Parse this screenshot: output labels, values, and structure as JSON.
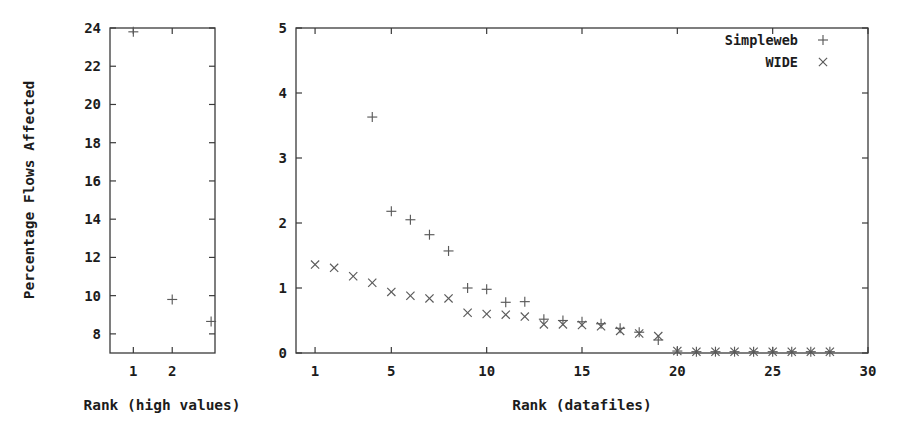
{
  "figure": {
    "background_color": "#ffffff",
    "marker_color": "#5a5a5a",
    "axis_color": "#3a3a3a"
  },
  "chart_data": [
    {
      "id": "left-panel",
      "type": "scatter",
      "title": "",
      "xlabel": "Rank (high values)",
      "ylabel": "Percentage Flows Affected",
      "xlim": [
        0.4,
        3.1
      ],
      "ylim": [
        7.0,
        24.0
      ],
      "xticks": [
        "1",
        "2"
      ],
      "xtick_values": [
        1,
        2
      ],
      "yticks": [
        "8",
        "10",
        "12",
        "14",
        "16",
        "18",
        "20",
        "22",
        "24"
      ],
      "ytick_values": [
        8,
        10,
        12,
        14,
        16,
        18,
        20,
        22,
        24
      ],
      "grid": false,
      "legend": "none",
      "series": [
        {
          "name": "Simpleweb",
          "marker": "plus",
          "x": [
            1,
            2,
            3
          ],
          "y": [
            23.8,
            9.8,
            8.65
          ]
        }
      ]
    },
    {
      "id": "right-panel",
      "type": "scatter",
      "title": "",
      "xlabel": "Rank (datafiles)",
      "ylabel": "",
      "xlim": [
        0.0,
        30.0
      ],
      "ylim": [
        0.0,
        5.0
      ],
      "xticks": [
        "1",
        "5",
        "10",
        "15",
        "20",
        "25",
        "30"
      ],
      "xtick_values": [
        1,
        5,
        10,
        15,
        20,
        25,
        30
      ],
      "yticks": [
        "0",
        "1",
        "2",
        "3",
        "4",
        "5"
      ],
      "ytick_values": [
        0,
        1,
        2,
        3,
        4,
        5
      ],
      "grid": false,
      "legend": "top-right",
      "series": [
        {
          "name": "Simpleweb",
          "marker": "plus",
          "x": [
            4,
            5,
            6,
            7,
            8,
            9,
            10,
            11,
            12,
            13,
            14,
            15,
            16,
            17,
            18,
            19,
            20,
            21,
            22,
            23,
            24,
            25,
            26,
            27,
            28
          ],
          "y": [
            3.63,
            2.18,
            2.05,
            1.82,
            1.57,
            1.0,
            0.98,
            0.78,
            0.79,
            0.52,
            0.5,
            0.48,
            0.45,
            0.38,
            0.32,
            0.2,
            0.03,
            0.02,
            0.02,
            0.02,
            0.02,
            0.02,
            0.02,
            0.02,
            0.02
          ]
        },
        {
          "name": "WIDE",
          "marker": "cross",
          "x": [
            1,
            2,
            3,
            4,
            5,
            6,
            7,
            8,
            9,
            10,
            11,
            12,
            13,
            14,
            15,
            16,
            17,
            18,
            19,
            20,
            21,
            22,
            23,
            24,
            25,
            26,
            27,
            28
          ],
          "y": [
            1.36,
            1.31,
            1.18,
            1.08,
            0.94,
            0.88,
            0.84,
            0.84,
            0.62,
            0.6,
            0.59,
            0.56,
            0.44,
            0.44,
            0.43,
            0.41,
            0.34,
            0.3,
            0.26,
            0.03,
            0.02,
            0.02,
            0.02,
            0.02,
            0.02,
            0.02,
            0.02,
            0.02
          ]
        }
      ]
    }
  ],
  "legend": {
    "entries": [
      {
        "label": "Simpleweb",
        "marker": "plus"
      },
      {
        "label": "WIDE",
        "marker": "cross"
      }
    ]
  }
}
